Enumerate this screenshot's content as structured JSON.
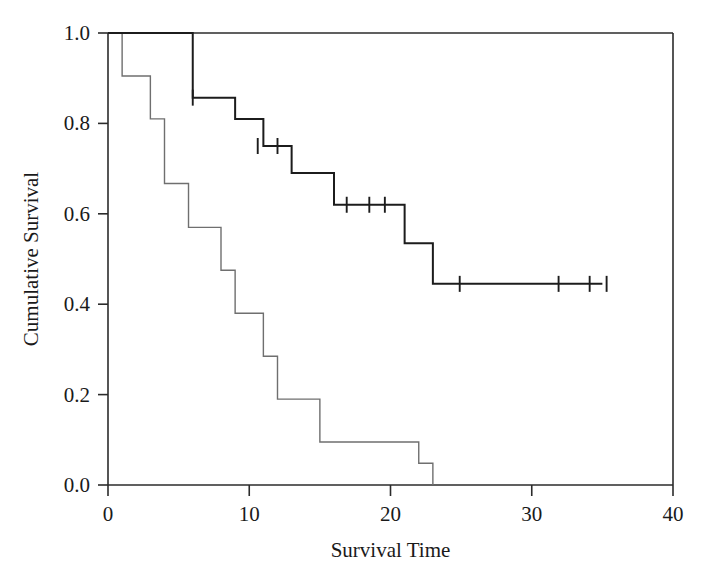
{
  "chart_data": {
    "type": "line",
    "title": "",
    "subtitle": "",
    "xlabel": "Survival Time",
    "ylabel": "Cumulative Survival",
    "xlim": [
      0,
      40
    ],
    "ylim": [
      0.0,
      1.0
    ],
    "xticks": [
      0,
      10,
      20,
      30,
      40
    ],
    "xtick_labels": [
      "0",
      "10",
      "20",
      "30",
      "40"
    ],
    "yticks": [
      0.0,
      0.2,
      0.4,
      0.6,
      0.8,
      1.0
    ],
    "ytick_labels": [
      "0.0",
      "0.2",
      "0.4",
      "0.6",
      "0.8",
      "1.0"
    ],
    "grid": false,
    "legend_position": "none",
    "plot_style": "kaplan-meier step",
    "series": [
      {
        "name": "Upper survival curve",
        "color": "#1c1c1c",
        "line_style": "step-post bold",
        "x": [
          0,
          6,
          6,
          9,
          11,
          13,
          16,
          21,
          23,
          35
        ],
        "y": [
          1.0,
          1.0,
          0.857,
          0.81,
          0.75,
          0.69,
          0.62,
          0.535,
          0.445,
          0.445
        ],
        "steps": [
          {
            "time": 0,
            "survival": 1.0
          },
          {
            "time": 6,
            "survival": 0.857
          },
          {
            "time": 9,
            "survival": 0.81
          },
          {
            "time": 11,
            "survival": 0.75
          },
          {
            "time": 13,
            "survival": 0.69
          },
          {
            "time": 16,
            "survival": 0.62
          },
          {
            "time": 21,
            "survival": 0.535
          },
          {
            "time": 23,
            "survival": 0.445
          },
          {
            "time": 35,
            "survival": 0.445
          }
        ],
        "censored": [
          {
            "time": 6.0,
            "survival": 0.857
          },
          {
            "time": 10.6,
            "survival": 0.75
          },
          {
            "time": 12.0,
            "survival": 0.75
          },
          {
            "time": 16.9,
            "survival": 0.62
          },
          {
            "time": 18.5,
            "survival": 0.62
          },
          {
            "time": 19.6,
            "survival": 0.62
          },
          {
            "time": 24.9,
            "survival": 0.445
          },
          {
            "time": 31.9,
            "survival": 0.445
          },
          {
            "time": 34.1,
            "survival": 0.445
          },
          {
            "time": 35.3,
            "survival": 0.445
          }
        ]
      },
      {
        "name": "Lower survival curve",
        "color": "#6f6f6f",
        "line_style": "step-post thin",
        "x": [
          0,
          1,
          3,
          4,
          5.7,
          8,
          9,
          11,
          12,
          15,
          22,
          23
        ],
        "y": [
          1.0,
          0.905,
          0.81,
          0.667,
          0.57,
          0.475,
          0.38,
          0.285,
          0.19,
          0.095,
          0.048,
          0.0
        ],
        "steps": [
          {
            "time": 0,
            "survival": 1.0
          },
          {
            "time": 1,
            "survival": 0.905
          },
          {
            "time": 3,
            "survival": 0.81
          },
          {
            "time": 4,
            "survival": 0.667
          },
          {
            "time": 5.7,
            "survival": 0.57
          },
          {
            "time": 8,
            "survival": 0.475
          },
          {
            "time": 9,
            "survival": 0.38
          },
          {
            "time": 11,
            "survival": 0.285
          },
          {
            "time": 12,
            "survival": 0.19
          },
          {
            "time": 15,
            "survival": 0.095
          },
          {
            "time": 22,
            "survival": 0.048
          },
          {
            "time": 23,
            "survival": 0.0
          }
        ],
        "censored": []
      }
    ]
  },
  "axis": {
    "x_title": "Survival Time",
    "y_title": "Cumulative Survival",
    "x_tick_0": "0",
    "x_tick_1": "10",
    "x_tick_2": "20",
    "x_tick_3": "30",
    "x_tick_4": "40",
    "y_tick_0": "0.0",
    "y_tick_1": "0.2",
    "y_tick_2": "0.4",
    "y_tick_3": "0.6",
    "y_tick_4": "0.8",
    "y_tick_5": "1.0"
  },
  "colors": {
    "upper_curve": "#1c1c1c",
    "lower_curve": "#6f6f6f",
    "axis": "#2b2b2b",
    "background": "#ffffff"
  }
}
